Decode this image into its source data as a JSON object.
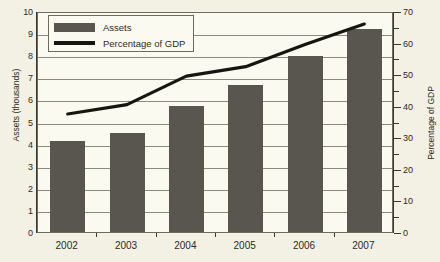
{
  "chart_data": {
    "type": "bar",
    "title": "",
    "xlabel": "",
    "categories": [
      "2002",
      "2003",
      "2004",
      "2005",
      "2006",
      "2007"
    ],
    "series": [
      {
        "name": "Assets",
        "type": "bar",
        "axis": "left",
        "unit": "thousands",
        "color": "#59564f",
        "values": [
          4.1,
          4.5,
          5.7,
          6.65,
          7.95,
          9.2
        ]
      },
      {
        "name": "Percentage of GDP",
        "type": "line",
        "axis": "right",
        "unit": "percent",
        "color": "#16150f",
        "values": [
          38,
          41,
          50,
          53,
          60,
          66.5
        ]
      }
    ],
    "left_axis": {
      "label": "Assets (thousands)",
      "ylim": [
        0,
        10
      ],
      "ticks": [
        0,
        1,
        2,
        3,
        4,
        5,
        6,
        7,
        8,
        9,
        10
      ],
      "tick_labels": [
        "0",
        "1",
        "2",
        "3",
        "4",
        "5",
        "6",
        "7",
        "8",
        "9",
        "10"
      ]
    },
    "right_axis": {
      "label": "Percentage of GDP",
      "ylim": [
        0,
        70
      ],
      "ticks": [
        0,
        5,
        10,
        15,
        20,
        25,
        30,
        35,
        40,
        45,
        50,
        55,
        60,
        65,
        70
      ],
      "labeled_ticks": [
        0,
        10,
        20,
        30,
        40,
        50,
        60,
        70
      ],
      "tick_labels": [
        "0",
        "10",
        "20",
        "30",
        "40",
        "50",
        "60",
        "70"
      ]
    },
    "grid": true,
    "legend_position": "top-left",
    "legend_entries": [
      "Assets",
      "Percentage of GDP"
    ]
  },
  "legend": {
    "assets_label": "Assets",
    "gdp_label": "Percentage of GDP"
  },
  "axes": {
    "left_title": "Assets (thousands)",
    "right_title": "Percentage of GDP"
  },
  "colors": {
    "bar": "#59564f",
    "line": "#16150f",
    "background": "#f3f1e4",
    "plot_background": "#fbfaf0",
    "grid": "#8d8a7d",
    "axis": "#3a3833"
  }
}
